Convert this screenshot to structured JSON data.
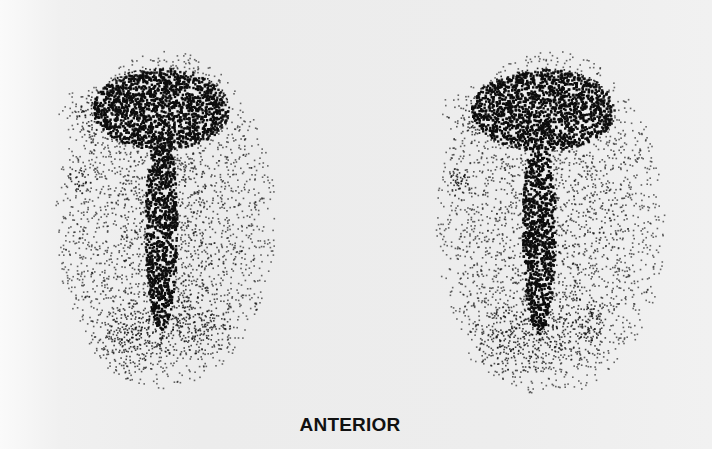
{
  "figure": {
    "caption": "ANTERIOR",
    "panels": [
      {
        "name": "left-scan",
        "x": 50,
        "y": 50,
        "w": 230,
        "h": 340
      },
      {
        "name": "right-scan",
        "x": 430,
        "y": 50,
        "w": 240,
        "h": 345
      }
    ],
    "colors": {
      "background": "#efefef",
      "uptake": "#0d0d0d",
      "caption": "#111111"
    }
  }
}
